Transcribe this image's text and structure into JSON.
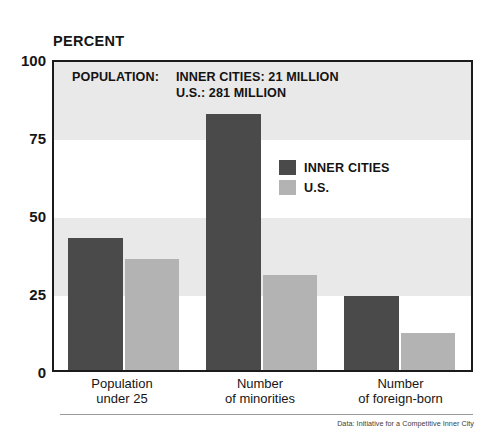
{
  "chart_data": {
    "type": "bar",
    "title": "",
    "ylabel": "PERCENT",
    "xlabel": "",
    "ylim": [
      0,
      100
    ],
    "yticks": [
      0,
      25,
      50,
      75,
      100
    ],
    "grid": "alternating horizontal bands every 25 units",
    "legend_position": "inside upper right",
    "categories": [
      "Population under 25",
      "Number of minorities",
      "Number of foreign-born"
    ],
    "series": [
      {
        "name": "INNER CITIES",
        "color": "#4a4a4a",
        "values": [
          43,
          83,
          24
        ]
      },
      {
        "name": "U.S.",
        "color": "#b3b3b3",
        "values": [
          36,
          31,
          12
        ]
      }
    ],
    "annotations": {
      "population_title": "POPULATION:",
      "population_line1": "INNER CITIES: 21 MILLION",
      "population_line2": "U.S.: 281 MILLION"
    },
    "source": "Data: Initiative for a Competitive Inner City"
  },
  "axis": {
    "y_title": "PERCENT",
    "ticks": {
      "t100": "100",
      "t75": "75",
      "t50": "50",
      "t25": "25",
      "t0": "0"
    }
  },
  "categories": {
    "c0_line1": "Population",
    "c0_line2": "under 25",
    "c1_line1": "Number",
    "c1_line2": "of minorities",
    "c2_line1": "Number",
    "c2_line2": "of foreign-born"
  },
  "callout": {
    "title": "POPULATION:",
    "line1": "INNER CITIES: 21 MILLION",
    "line2": "U.S.: 281 MILLION"
  },
  "legend": {
    "item0": "INNER CITIES",
    "item1": "U.S."
  },
  "source": {
    "text": "Data: Initiative for a Competitive Inner City"
  },
  "colors": {
    "inner_cities": "#4a4a4a",
    "us": "#b3b3b3",
    "band": "#e9e9e9",
    "frame": "#1b1b1b"
  }
}
